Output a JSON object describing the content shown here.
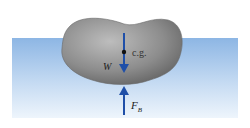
{
  "diagram": {
    "labels": {
      "cg": "c.g.",
      "weight": "W",
      "buoyant_force": "F",
      "buoyant_subscript": "B"
    },
    "colors": {
      "water_top": "#8fb8e6",
      "water_bottom": "#eef5fc",
      "rock": "#8a8a8a",
      "arrow": "#1f4fa8"
    }
  }
}
